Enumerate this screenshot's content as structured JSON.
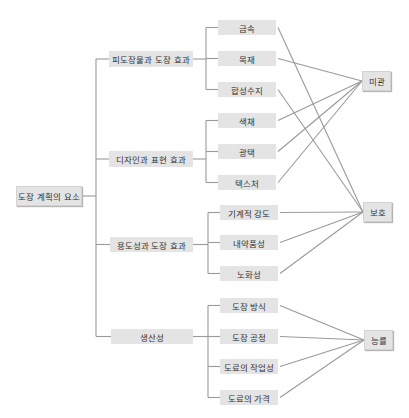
{
  "diagram": {
    "root": {
      "label": "도장 계획의 요소",
      "x": 16,
      "y": 186,
      "w": 66,
      "h": 20
    },
    "groups": [
      {
        "label": "피도장물과 도장 효과",
        "x": 109,
        "y": 51,
        "w": 84,
        "h": 16,
        "children": [
          {
            "label": "금속",
            "x": 218,
            "y": 20,
            "w": 58,
            "h": 15,
            "target": "protection"
          },
          {
            "label": "목재",
            "x": 218,
            "y": 51,
            "w": 58,
            "h": 15,
            "target": "aesthetics"
          },
          {
            "label": "합성수지",
            "x": 218,
            "y": 82,
            "w": 58,
            "h": 15,
            "target": "protection"
          }
        ]
      },
      {
        "label": "디자인과 표현 효과",
        "x": 109,
        "y": 151,
        "w": 84,
        "h": 16,
        "children": [
          {
            "label": "색채",
            "x": 218,
            "y": 113,
            "w": 58,
            "h": 15,
            "target": "aesthetics"
          },
          {
            "label": "광택",
            "x": 218,
            "y": 144,
            "w": 58,
            "h": 15,
            "target": "aesthetics"
          },
          {
            "label": "텍스처",
            "x": 218,
            "y": 175,
            "w": 58,
            "h": 15,
            "target": "aesthetics"
          }
        ]
      },
      {
        "label": "용도성과 도장 효과",
        "x": 110,
        "y": 237,
        "w": 83,
        "h": 15,
        "children": [
          {
            "label": "기계적 강도",
            "x": 220,
            "y": 205,
            "w": 58,
            "h": 15,
            "target": "protection"
          },
          {
            "label": "내약품성",
            "x": 220,
            "y": 235,
            "w": 58,
            "h": 15,
            "target": "protection"
          },
          {
            "label": "노화성",
            "x": 220,
            "y": 266,
            "w": 58,
            "h": 15,
            "target": "protection"
          }
        ]
      },
      {
        "label": "생산성",
        "x": 111,
        "y": 329,
        "w": 82,
        "h": 15,
        "children": [
          {
            "label": "도장 방식",
            "x": 220,
            "y": 298,
            "w": 58,
            "h": 15,
            "target": "efficiency"
          },
          {
            "label": "도장 공정",
            "x": 220,
            "y": 329,
            "w": 58,
            "h": 15,
            "target": "efficiency"
          },
          {
            "label": "도료의 작업성",
            "x": 220,
            "y": 359,
            "w": 58,
            "h": 15,
            "target": "efficiency"
          },
          {
            "label": "도료의 가격",
            "x": 220,
            "y": 390,
            "w": 58,
            "h": 15,
            "target": "efficiency"
          }
        ]
      }
    ],
    "targets": {
      "aesthetics": {
        "label": "미관",
        "x": 362,
        "y": 71,
        "w": 29,
        "h": 20
      },
      "protection": {
        "label": "보호",
        "x": 363,
        "y": 202,
        "w": 29,
        "h": 20
      },
      "efficiency": {
        "label": "능률",
        "x": 364,
        "y": 330,
        "w": 29,
        "h": 20
      }
    },
    "line_color": "#9a9a9a",
    "box_color": "#e4e4e4"
  }
}
